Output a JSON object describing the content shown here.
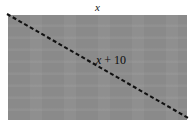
{
  "figure": {
    "name": "rectangle-with-diagonal",
    "shape": {
      "type": "rectangle",
      "fill_color": "#8a8a8a",
      "border_color": "#8a8a8a",
      "x": 8,
      "y": 15,
      "width": 179,
      "height": 105
    },
    "diagonal": {
      "style": "dashed",
      "color": "#111111",
      "stroke_width": 2.1,
      "dash_pattern": "4 2.6",
      "x1": 7,
      "y1": 14,
      "x2": 190,
      "y2": 119
    },
    "labels": {
      "top": {
        "text": "x",
        "style": "italic",
        "position": "top-center"
      },
      "diagonal": {
        "variable": "x",
        "operator": "+",
        "constant": "10",
        "full_text": "x + 10",
        "position": "interior-center"
      }
    }
  },
  "colors": {
    "background": "#ffffff",
    "shading": "#8a8a8a",
    "ink": "#111111"
  }
}
